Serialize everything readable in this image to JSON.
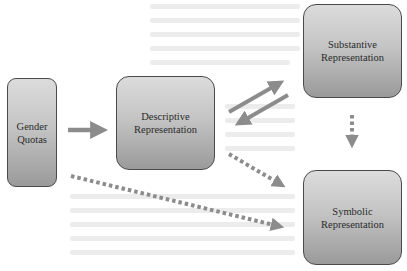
{
  "diagram": {
    "nodes": [
      {
        "id": "gender-quotas",
        "label": "Gender\nQuotas"
      },
      {
        "id": "descriptive",
        "label": "Descriptive\nRepresentation"
      },
      {
        "id": "substantive",
        "label": "Substantive\nRepresentation"
      },
      {
        "id": "symbolic",
        "label": "Symbolic\nRepresentation"
      }
    ],
    "edges": [
      {
        "from": "gender-quotas",
        "to": "descriptive",
        "style": "solid"
      },
      {
        "from": "descriptive",
        "to": "substantive",
        "style": "solid"
      },
      {
        "from": "substantive",
        "to": "descriptive",
        "style": "solid"
      },
      {
        "from": "substantive",
        "to": "symbolic",
        "style": "dotted"
      },
      {
        "from": "descriptive",
        "to": "symbolic",
        "style": "dotted"
      },
      {
        "from": "gender-quotas",
        "to": "symbolic",
        "style": "dotted"
      }
    ],
    "colors": {
      "arrow": "#8c8c8c",
      "box_border": "#4a4a4a",
      "box_fill_top": "#dcdcdc",
      "box_fill_bottom": "#9a9a9a",
      "text": "#2b2b2b"
    }
  }
}
